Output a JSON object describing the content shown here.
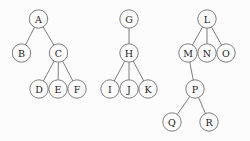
{
  "figure": {
    "title": "",
    "background_color": "#fcfcfc",
    "node_fill": "#fcfcfc",
    "stroke_color": "#6f6f6f",
    "label_color": "#1a1a1a",
    "node_radius": 9.2
  },
  "chart_data": {
    "type": "diagram",
    "subtype": "rooted-tree-forest",
    "title": "",
    "xlabel": "",
    "ylabel": "",
    "trees": [
      {
        "name": "tree-1",
        "root": "A",
        "nodes": [
          {
            "id": "A",
            "label": "A",
            "x": 38.5,
            "y": 19
          },
          {
            "id": "B",
            "label": "B",
            "x": 21.5,
            "y": 53
          },
          {
            "id": "C",
            "label": "C",
            "x": 58.5,
            "y": 53
          },
          {
            "id": "D",
            "label": "D",
            "x": 39,
            "y": 89
          },
          {
            "id": "E",
            "label": "E",
            "x": 58,
            "y": 89
          },
          {
            "id": "F",
            "label": "F",
            "x": 77,
            "y": 89
          }
        ],
        "edges": [
          {
            "from": "A",
            "to": "B"
          },
          {
            "from": "A",
            "to": "C"
          },
          {
            "from": "C",
            "to": "D"
          },
          {
            "from": "C",
            "to": "E"
          },
          {
            "from": "C",
            "to": "F"
          }
        ]
      },
      {
        "name": "tree-2",
        "root": "G",
        "nodes": [
          {
            "id": "G",
            "label": "G",
            "x": 129,
            "y": 19
          },
          {
            "id": "H",
            "label": "H",
            "x": 129,
            "y": 53
          },
          {
            "id": "I",
            "label": "I",
            "x": 110,
            "y": 89
          },
          {
            "id": "J",
            "label": "J",
            "x": 129,
            "y": 89
          },
          {
            "id": "K",
            "label": "K",
            "x": 148,
            "y": 89
          }
        ],
        "edges": [
          {
            "from": "G",
            "to": "H"
          },
          {
            "from": "H",
            "to": "I"
          },
          {
            "from": "H",
            "to": "J"
          },
          {
            "from": "H",
            "to": "K"
          }
        ]
      },
      {
        "name": "tree-3",
        "root": "L",
        "nodes": [
          {
            "id": "L",
            "label": "L",
            "x": 207,
            "y": 19
          },
          {
            "id": "M",
            "label": "M",
            "x": 188,
            "y": 53
          },
          {
            "id": "N",
            "label": "N",
            "x": 207,
            "y": 53
          },
          {
            "id": "O",
            "label": "O",
            "x": 226,
            "y": 53
          },
          {
            "id": "P",
            "label": "P",
            "x": 195,
            "y": 89
          },
          {
            "id": "Q",
            "label": "Q",
            "x": 172,
            "y": 122
          },
          {
            "id": "R",
            "label": "R",
            "x": 209,
            "y": 122
          }
        ],
        "edges": [
          {
            "from": "L",
            "to": "M"
          },
          {
            "from": "L",
            "to": "N"
          },
          {
            "from": "L",
            "to": "O"
          },
          {
            "from": "M",
            "to": "P"
          },
          {
            "from": "P",
            "to": "Q"
          },
          {
            "from": "P",
            "to": "R"
          }
        ]
      }
    ]
  }
}
